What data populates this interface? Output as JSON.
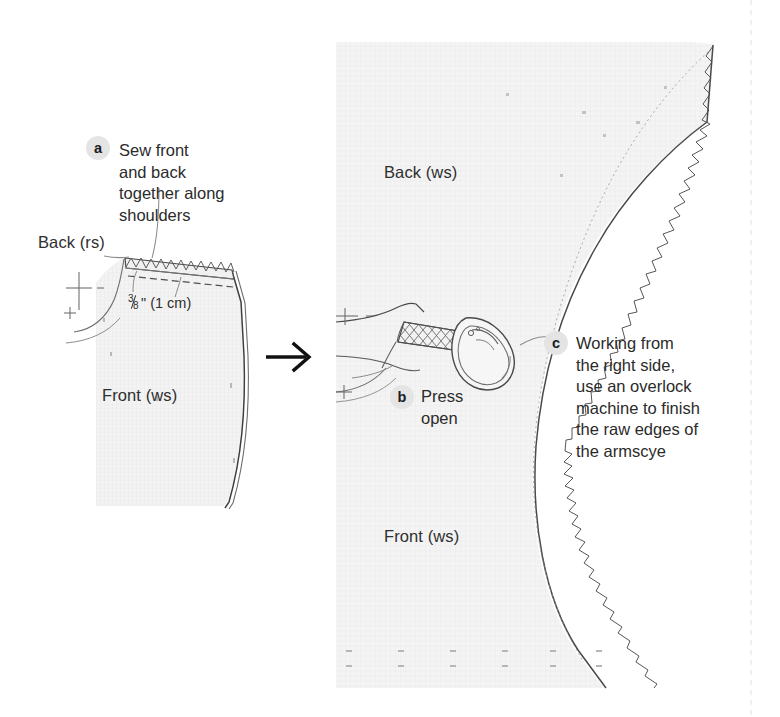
{
  "page": {
    "background_color": "#ffffff",
    "margin_rule_color": "#e8e8e8"
  },
  "colors": {
    "ink": "#2b2b2b",
    "fabric_fill": "#f2f2f2",
    "fabric_line": "#4a4a4a",
    "badge_bg": "#e4e4e4",
    "badge_text": "#1c1c1c",
    "arrow": "#111111"
  },
  "transition_arrow": {
    "icon": "arrow-right-icon",
    "glyph": "→"
  },
  "left_panel": {
    "name": "step-a-illustration",
    "labels": {
      "back": "Back (rs)",
      "front": "Front (ws)",
      "seam_allowance_fraction_numerator": "3",
      "seam_allowance_fraction_denominator": "8",
      "seam_allowance_rest": "\" (1 cm)"
    },
    "callout": {
      "key": "a",
      "text": "Sew front\nand back\ntogether along\nshoulders"
    }
  },
  "right_panel": {
    "name": "step-bc-illustration",
    "labels": {
      "back": "Back (ws)",
      "front": "Front (ws)"
    },
    "callouts": [
      {
        "key": "b",
        "text": "Press\nopen"
      },
      {
        "key": "c",
        "text": "Working from\nthe right side,\nuse an overlock\nmachine to finish\nthe raw edges of\nthe armscye"
      }
    ],
    "iron": {
      "icon": "iron-icon"
    }
  }
}
